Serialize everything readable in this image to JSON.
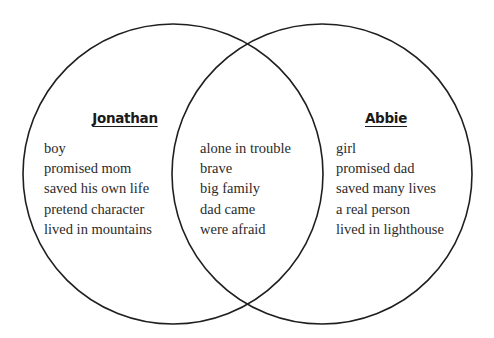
{
  "diagram": {
    "type": "venn-2-set",
    "background_color": "#ffffff",
    "stroke_color": "#1f1f1f",
    "text_color": "#2b2b2b",
    "left_set": {
      "title": "Jonathan",
      "items": [
        "boy",
        "promised mom",
        "saved his own life",
        "pretend character",
        "lived in mountains"
      ]
    },
    "intersection": {
      "title": "",
      "items": [
        "alone in trouble",
        "brave",
        "big family",
        "dad came",
        "were afraid"
      ]
    },
    "right_set": {
      "title": "Abbie",
      "items": [
        "girl",
        "promised dad",
        "saved many lives",
        "a real person",
        "lived in lighthouse"
      ]
    }
  }
}
